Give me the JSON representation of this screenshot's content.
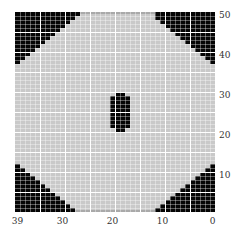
{
  "chart_data": {
    "type": "heatmap",
    "title": "",
    "xlabel": "",
    "ylabel": "",
    "grid": {
      "columns": 40,
      "rows": 50,
      "cell_w": 5,
      "cell_h": 4,
      "major_every": 5
    },
    "x_range": [
      39,
      0
    ],
    "y_range": [
      0,
      50
    ],
    "x_ticks": [
      {
        "label": "39",
        "col": 0
      },
      {
        "label": "30",
        "col": 9
      },
      {
        "label": "20",
        "col": 19
      },
      {
        "label": "10",
        "col": 29
      },
      {
        "label": "0",
        "col": 39
      }
    ],
    "y_ticks": [
      {
        "label": "50",
        "row": 0
      },
      {
        "label": "40",
        "row": 10
      },
      {
        "label": "30",
        "row": 20
      },
      {
        "label": "20",
        "row": 30
      },
      {
        "label": "10",
        "row": 40
      }
    ],
    "colors": {
      "background": "#c9c9c9",
      "filled": "#050505",
      "grid_major": "#ffffff"
    },
    "regions": {
      "top_left_counts": [
        13,
        12,
        11,
        10,
        9,
        8,
        7,
        6,
        5,
        4,
        3,
        2,
        1
      ],
      "top_right_counts": [
        12,
        12,
        11,
        10,
        9,
        8,
        7,
        6,
        5,
        4,
        3,
        2,
        1
      ],
      "bottom_left_start_row": 38,
      "bottom_left_counts": [
        1,
        2,
        3,
        4,
        5,
        6,
        7,
        8,
        9,
        10,
        11,
        12
      ],
      "bottom_right_start_row": 38,
      "bottom_right_counts": [
        1,
        2,
        3,
        4,
        5,
        6,
        7,
        8,
        9,
        10,
        11,
        12
      ],
      "center_block": {
        "rows": [
          20,
          21,
          22,
          23,
          24,
          25,
          26,
          27,
          28,
          29
        ],
        "full_cols": [
          19,
          20,
          21,
          22
        ],
        "edge_cols": [
          20,
          21
        ]
      }
    }
  }
}
